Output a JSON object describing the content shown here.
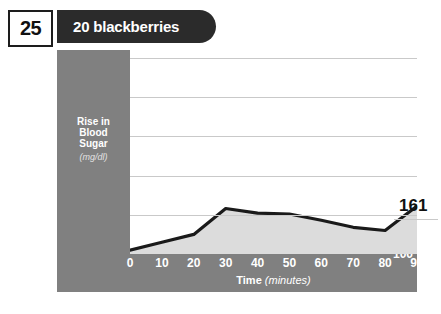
{
  "header": {
    "number": "25",
    "title": "20 blackberries"
  },
  "colors": {
    "panel": "#808080",
    "banner": "#2b2b2b",
    "area_fill": "#dcdcdc",
    "line": "#1a1a1a",
    "grid": "#c9c9c9",
    "tick_text": "#ffffff"
  },
  "chart_data": {
    "type": "area",
    "title": "20 blackberries",
    "xlabel": "Time",
    "xlabel_unit": "(minutes)",
    "ylabel": "Rise in Blood Sugar",
    "ylabel_line1": "Rise in",
    "ylabel_line2": "Blood",
    "ylabel_line3": "Sugar",
    "ylabel_unit": "(mg/dl)",
    "x": [
      0,
      10,
      20,
      30,
      40,
      50,
      60,
      70,
      80,
      90
    ],
    "values": [
      105,
      115,
      125,
      158,
      152,
      151,
      143,
      134,
      130,
      161
    ],
    "xticks": [
      "0",
      "10",
      "20",
      "30",
      "40",
      "50",
      "60",
      "70",
      "80",
      "90"
    ],
    "yticks": [
      "100",
      "150",
      "200",
      "250",
      "300",
      "350"
    ],
    "ytick_values": [
      100,
      150,
      200,
      250,
      300,
      350
    ],
    "xlim": [
      0,
      90
    ],
    "ylim": [
      100,
      360
    ],
    "grid": true,
    "legend": "none",
    "end_label": "161"
  }
}
